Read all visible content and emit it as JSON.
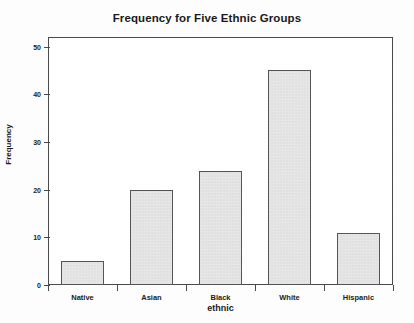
{
  "chart_data": {
    "type": "bar",
    "title": "Frequency for Five Ethnic Groups",
    "xlabel": "ethnic",
    "ylabel": "Frequency",
    "categories": [
      "Native",
      "Asian",
      "Black",
      "White",
      "Hispanic"
    ],
    "values": [
      5,
      20,
      24,
      45,
      11
    ],
    "ylim": [
      0,
      52
    ],
    "yticks": [
      0,
      10,
      20,
      30,
      40,
      50
    ],
    "ytick_labels": [
      "0",
      "10",
      "20",
      "30",
      "40",
      "50"
    ],
    "grid": false,
    "legend": null,
    "bar_fill_color": "#e9e9e9",
    "bar_edge_color": "#555555",
    "axis_color": "#4a4a4a",
    "background_color": "#ffffff"
  }
}
